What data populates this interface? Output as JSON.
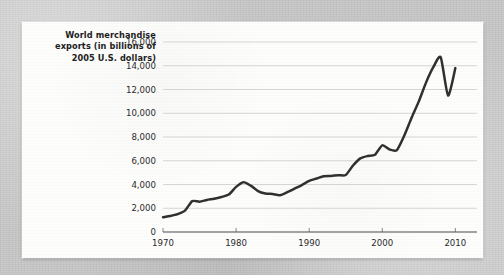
{
  "panel": {
    "axis_title_lines": [
      "World merchandise",
      "exports (in billions of",
      "2005 U.S. dollars)"
    ],
    "axis_title_full": "World merchandise exports (in billions of 2005 U.S. dollars)"
  },
  "chart_data": {
    "type": "line",
    "title": "",
    "subtitle": "",
    "xlabel": "",
    "ylabel": "World merchandise exports (in billions of 2005 U.S. dollars)",
    "xlim": [
      1970,
      2010.5
    ],
    "ylim": [
      0,
      16000
    ],
    "grid": true,
    "legend": false,
    "legend_position": "none",
    "yticks": [
      0,
      2000,
      4000,
      6000,
      8000,
      10000,
      12000,
      14000,
      16000
    ],
    "ytick_labels": [
      "0",
      "2,000",
      "4,000",
      "6,000",
      "8,000",
      "10,000",
      "12,000",
      "14,000",
      "16,000"
    ],
    "xticks": [
      1970,
      1980,
      1990,
      2000,
      2010
    ],
    "xtick_labels": [
      "1970",
      "1980",
      "1990",
      "2000",
      "2010"
    ],
    "line_color": "#303030",
    "grid_color": "#c4c4c4",
    "x": [
      1970,
      1971,
      1972,
      1973,
      1974,
      1975,
      1976,
      1977,
      1978,
      1979,
      1980,
      1981,
      1982,
      1983,
      1984,
      1985,
      1986,
      1987,
      1988,
      1989,
      1990,
      1991,
      1992,
      1993,
      1994,
      1995,
      1996,
      1997,
      1998,
      1999,
      2000,
      2001,
      2002,
      2003,
      2004,
      2005,
      2006,
      2007,
      2008,
      2009,
      2010
    ],
    "values": [
      1250,
      1350,
      1500,
      1800,
      2600,
      2550,
      2700,
      2800,
      2950,
      3150,
      3800,
      4200,
      3900,
      3450,
      3250,
      3200,
      3100,
      3350,
      3650,
      3950,
      4300,
      4500,
      4700,
      4720,
      4780,
      4800,
      5600,
      6200,
      6400,
      6500,
      7300,
      6950,
      6900,
      8100,
      9600,
      11000,
      12600,
      13900,
      14700,
      11500,
      13800
    ],
    "series": [
      {
        "name": "World merchandise exports",
        "values": [
          1250,
          1350,
          1500,
          1800,
          2600,
          2550,
          2700,
          2800,
          2950,
          3150,
          3800,
          4200,
          3900,
          3450,
          3250,
          3200,
          3100,
          3350,
          3650,
          3950,
          4300,
          4500,
          4700,
          4720,
          4780,
          4800,
          5600,
          6200,
          6400,
          6500,
          7300,
          6950,
          6900,
          8100,
          9600,
          11000,
          12600,
          13900,
          14700,
          11500,
          13800
        ]
      }
    ],
    "annotations": []
  }
}
